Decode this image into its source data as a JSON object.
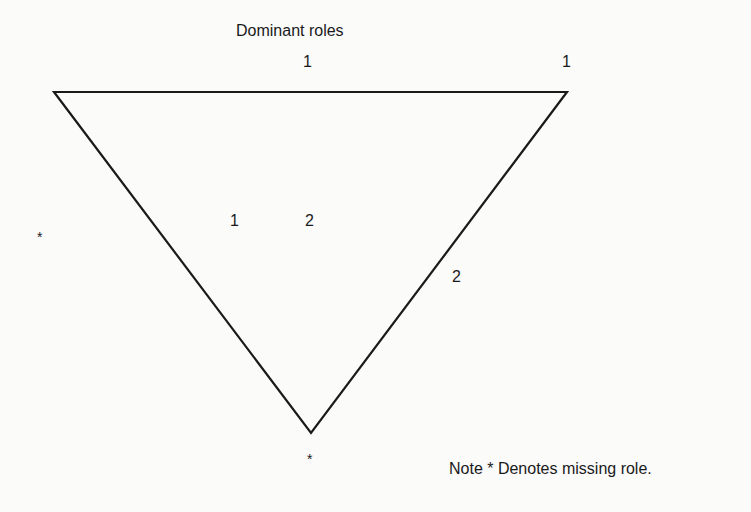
{
  "title": "Dominant roles",
  "triangle": {
    "stroke_color": "#1a1a1a",
    "stroke_width": 2.2,
    "vertices": {
      "top_left": [
        54,
        92
      ],
      "top_right": [
        567,
        92
      ],
      "bottom": [
        311,
        433
      ]
    }
  },
  "labels": {
    "top_edge_mid": "1",
    "top_right_corner": "1",
    "interior_left": "1",
    "interior_right": "2",
    "right_edge": "2",
    "left_vertex_marker": "*",
    "bottom_vertex_marker": "*"
  },
  "note": "Note * Denotes missing role.",
  "colors": {
    "background": "#fbfbfa",
    "ink": "#1a1a1a"
  }
}
